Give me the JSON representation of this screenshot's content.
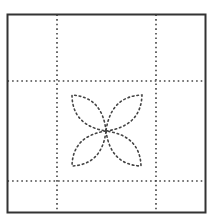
{
  "diagram": {
    "type": "quilt-block-pattern",
    "background": "#ffffff",
    "frame": {
      "x": 7.5,
      "y": 14.5,
      "width": 198,
      "height": 198,
      "stroke": "#333333",
      "stroke_width": 2
    },
    "grid_lines": {
      "stroke": "#444444",
      "stroke_width": 1.6,
      "dash": "1.6 3",
      "vertical_x": [
        57,
        156
      ],
      "horizontal_y": [
        81,
        181
      ]
    },
    "flower": {
      "center": [
        106,
        131
      ],
      "stroke": "#444444",
      "stroke_width": 1.6,
      "dash": "1.6 3",
      "petals": [
        {
          "name": "top-left",
          "tip": [
            72,
            95
          ]
        },
        {
          "name": "top-right",
          "tip": [
            142,
            95
          ]
        },
        {
          "name": "bottom-left",
          "tip": [
            72,
            166
          ]
        },
        {
          "name": "bottom-right",
          "tip": [
            141,
            166
          ]
        }
      ]
    }
  }
}
